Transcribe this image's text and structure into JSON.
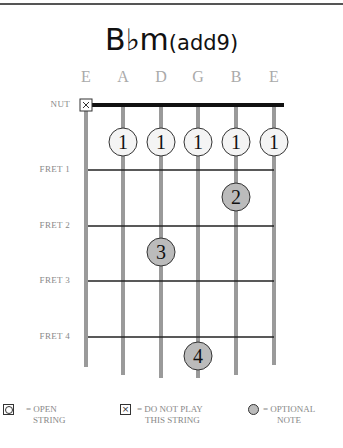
{
  "chord": {
    "root": "B♭m",
    "extension": "(add9)"
  },
  "string_names": [
    "E",
    "A",
    "D",
    "G",
    "B",
    "E"
  ],
  "labels": {
    "nut": "NUT",
    "frets": [
      "FRET 1",
      "FRET 2",
      "FRET 3",
      "FRET 4"
    ]
  },
  "markers": [
    {
      "string": 1,
      "type": "muted"
    }
  ],
  "fingers": [
    {
      "string": 2,
      "fret": 1,
      "finger": "1",
      "style": "open"
    },
    {
      "string": 3,
      "fret": 1,
      "finger": "1",
      "style": "open"
    },
    {
      "string": 4,
      "fret": 1,
      "finger": "1",
      "style": "open"
    },
    {
      "string": 5,
      "fret": 1,
      "finger": "1",
      "style": "open"
    },
    {
      "string": 6,
      "fret": 1,
      "finger": "1",
      "style": "open"
    },
    {
      "string": 5,
      "fret": 2,
      "finger": "2",
      "style": "optional"
    },
    {
      "string": 3,
      "fret": 3,
      "finger": "3",
      "style": "optional"
    },
    {
      "string": 4,
      "fret": 5,
      "finger": "4",
      "style": "optional"
    }
  ],
  "legend": [
    {
      "icon": "open-string-icon",
      "line1": "= OPEN",
      "line2": "STRING"
    },
    {
      "icon": "muted-string-icon",
      "line1": "= DO NOT PLAY",
      "line2": "THIS STRING"
    },
    {
      "icon": "optional-note-icon",
      "line1": "= OPTIONAL",
      "line2": "NOTE"
    }
  ],
  "colors": {
    "string": "#999999",
    "nut": "#111111",
    "optional_fill": "#bbbbbb",
    "open_fill": "#f4f4f4"
  }
}
